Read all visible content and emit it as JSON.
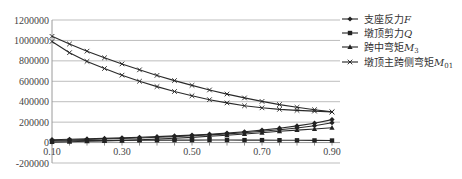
{
  "chart_data": {
    "type": "line",
    "title": "",
    "xlabel": "",
    "ylabel": "",
    "x": [
      0.1,
      0.15,
      0.2,
      0.25,
      0.3,
      0.35,
      0.4,
      0.45,
      0.5,
      0.55,
      0.6,
      0.65,
      0.7,
      0.75,
      0.8,
      0.85,
      0.9
    ],
    "x_tick_labels": [
      "0.10",
      "0.30",
      "0.50",
      "0.70",
      "0.90"
    ],
    "x_tick_values": [
      0.1,
      0.3,
      0.5,
      0.7,
      0.9
    ],
    "y_tick_labels": [
      "1200000",
      "1000000",
      "800000",
      "600000",
      "400000",
      "200000",
      "0",
      "-200000"
    ],
    "y_tick_values": [
      1200000,
      1000000,
      800000,
      600000,
      400000,
      200000,
      0,
      -200000
    ],
    "ylim": [
      -200000,
      1200000
    ],
    "xlim": [
      0.1,
      0.9
    ],
    "grid": {
      "horizontal": true,
      "vertical": false
    },
    "legend_position": "right",
    "series": [
      {
        "name": "支座反力F",
        "legend_label": "支座反力",
        "legend_symbol": "F",
        "marker": "diamond",
        "values": [
          28000,
          32000,
          36000,
          41000,
          46000,
          52000,
          58000,
          65000,
          73000,
          82000,
          93000,
          106000,
          122000,
          141000,
          163000,
          190000,
          225000
        ]
      },
      {
        "name": "墩顶剪力Q",
        "legend_label": "墩顶剪力",
        "legend_symbol": "Q",
        "marker": "square",
        "values": [
          15000,
          17000,
          19000,
          20000,
          21000,
          22000,
          23000,
          24000,
          24000,
          25000,
          25000,
          24000,
          24000,
          23000,
          22000,
          21000,
          20000
        ]
      },
      {
        "name": "跨中弯矩M3",
        "legend_label": "跨中弯矩",
        "legend_symbol": "M",
        "legend_subscript": "3",
        "marker": "triangle",
        "values": [
          5000,
          8000,
          12000,
          16000,
          21000,
          27000,
          34000,
          42000,
          51000,
          61000,
          72000,
          84000,
          97000,
          110000,
          122000,
          133000,
          145000
        ]
      },
      {
        "name": "墩顶主跨侧弯矩M01",
        "legend_label": "墩顶主跨侧弯矩",
        "legend_symbol": "M",
        "legend_subscript": "01",
        "marker": "x",
        "values": [
          1040000,
          965000,
          895000,
          830000,
          770000,
          712000,
          658000,
          607000,
          560000,
          515000,
          475000,
          437000,
          403000,
          372000,
          345000,
          322000,
          300000
        ]
      },
      {
        "name": "墩顶主跨侧弯矩M01 (lower)",
        "legend_label": "",
        "marker": "x",
        "values": [
          990000,
          880000,
          795000,
          725000,
          660000,
          600000,
          548000,
          500000,
          458000,
          420000,
          388000,
          360000,
          340000,
          325000,
          315000,
          308000,
          300000
        ]
      },
      {
        "name": "mid curve",
        "legend_label": "",
        "marker": "diamond",
        "values": [
          20000,
          25000,
          30000,
          35000,
          40000,
          45000,
          52000,
          58000,
          66000,
          75000,
          85000,
          97000,
          110000,
          125000,
          143000,
          165000,
          195000
        ]
      }
    ]
  },
  "legend": {
    "items": [
      {
        "label": "支座反力",
        "symbol": "F",
        "sub": ""
      },
      {
        "label": "墩顶剪力",
        "symbol": "Q",
        "sub": ""
      },
      {
        "label": "跨中弯矩",
        "symbol": "M",
        "sub": "3"
      },
      {
        "label": "墩顶主跨侧弯矩",
        "symbol": "M",
        "sub": "01"
      }
    ]
  }
}
